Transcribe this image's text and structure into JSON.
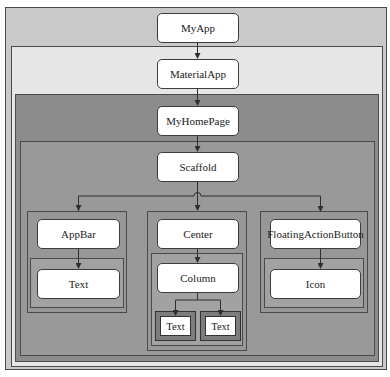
{
  "diagram": {
    "type": "widget-tree",
    "colors": {
      "myapp_layer": "#c9c9c9",
      "materialapp_layer": "#e6e6e6",
      "myhomepage_layer": "#8c8c8c",
      "scaffold_layer": "#999999",
      "group_layer": "#979797",
      "inner_layer": "#a2a2a2",
      "text_wrapper": "#7d7d7d",
      "node_fill": "#ffffff",
      "line": "#2e2e2e"
    },
    "nodes": {
      "myapp": "MyApp",
      "materialapp": "MaterialApp",
      "myhomepage": "MyHomePage",
      "scaffold": "Scaffold",
      "appbar": "AppBar",
      "appbar_text": "Text",
      "center": "Center",
      "column": "Column",
      "column_text_1": "Text",
      "column_text_2": "Text",
      "fab": "FloatingActionButton",
      "fab_icon": "Icon"
    },
    "edges": [
      [
        "MyApp",
        "MaterialApp"
      ],
      [
        "MaterialApp",
        "MyHomePage"
      ],
      [
        "MyHomePage",
        "Scaffold"
      ],
      [
        "Scaffold",
        "AppBar"
      ],
      [
        "Scaffold",
        "Center"
      ],
      [
        "Scaffold",
        "FloatingActionButton"
      ],
      [
        "AppBar",
        "Text"
      ],
      [
        "Center",
        "Column"
      ],
      [
        "Column",
        "Text"
      ],
      [
        "Column",
        "Text"
      ],
      [
        "FloatingActionButton",
        "Icon"
      ]
    ]
  }
}
